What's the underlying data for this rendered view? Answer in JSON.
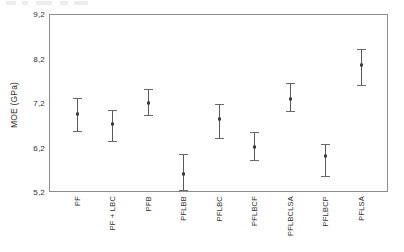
{
  "chart_data": {
    "type": "scatter",
    "title": "",
    "subtitle": "",
    "xlabel": "",
    "ylabel": "MOE (GPa)",
    "ylim": [
      5.2,
      9.2
    ],
    "yticks": [
      "5,2",
      "6,2",
      "7,2",
      "8,2",
      "9,2"
    ],
    "ytick_values": [
      5.2,
      6.2,
      7.2,
      8.2,
      9.2
    ],
    "decimal_separator": ",",
    "grid": false,
    "legend": null,
    "legend_position": "none",
    "error_bar_style": "mean with capped interval",
    "categories": [
      "PF",
      "PF + LBC",
      "PFB",
      "PFLBB",
      "PFLBC",
      "PFLBCF",
      "PFLBCLSA",
      "PFLBCP",
      "PFLSA"
    ],
    "series": [
      {
        "name": "MOE (GPa)",
        "values": [
          6.95,
          6.72,
          7.2,
          5.61,
          6.85,
          6.21,
          7.29,
          6.0,
          8.05
        ],
        "error_low": [
          6.55,
          6.33,
          6.91,
          5.23,
          6.39,
          5.9,
          6.99,
          5.53,
          7.59
        ],
        "error_high": [
          7.31,
          7.04,
          7.51,
          6.05,
          7.17,
          6.55,
          7.66,
          6.27,
          8.41
        ]
      }
    ],
    "points": [
      {
        "category": "PF",
        "mean": 6.95,
        "low": 6.55,
        "high": 7.31
      },
      {
        "category": "PF + LBC",
        "mean": 6.72,
        "low": 6.33,
        "high": 7.04
      },
      {
        "category": "PFB",
        "mean": 7.2,
        "low": 6.91,
        "high": 7.51
      },
      {
        "category": "PFLBB",
        "mean": 5.61,
        "low": 5.23,
        "high": 6.05
      },
      {
        "category": "PFLBC",
        "mean": 6.85,
        "low": 6.39,
        "high": 7.17
      },
      {
        "category": "PFLBCF",
        "mean": 6.21,
        "low": 5.9,
        "high": 6.55
      },
      {
        "category": "PFLBCLSA",
        "mean": 7.29,
        "low": 6.99,
        "high": 7.66
      },
      {
        "category": "PFLBCP",
        "mean": 6.0,
        "low": 5.53,
        "high": 6.27
      },
      {
        "category": "PFLSA",
        "mean": 8.05,
        "low": 7.59,
        "high": 8.41
      }
    ],
    "colors": {
      "frame": "#8c8c8c",
      "errorbar": "#5a5a5a",
      "marker": "#3d3d3d",
      "text": "#2e2e2e",
      "background": "#ffffff"
    }
  }
}
